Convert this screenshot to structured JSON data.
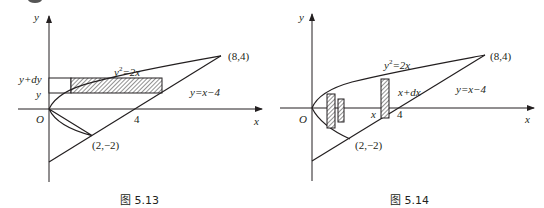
{
  "colors": {
    "ink": "#231f20",
    "hatch": "#555555"
  },
  "figures": [
    {
      "id": "fig1",
      "caption": "图 5.13",
      "axis_labels": {
        "x": "x",
        "y": "y",
        "origin": "O"
      },
      "tick_label_x": "4",
      "curve_label": "y²=2x",
      "curve_label_base": "y",
      "curve_label_sup": "2",
      "curve_label_rest": "=2x",
      "line_label": "y=x−4",
      "point_top": "(8,4)",
      "point_bottom": "(2,−2)",
      "strip_labels": {
        "upper": "y+dy",
        "lower": "y"
      },
      "strip_orientation": "horizontal"
    },
    {
      "id": "fig2",
      "caption": "图 5.14",
      "axis_labels": {
        "x": "x",
        "y": "y",
        "origin": "O"
      },
      "tick_label_x": "4",
      "curve_label_base": "y",
      "curve_label_sup": "2",
      "curve_label_rest": "=2x",
      "line_label": "y=x−4",
      "point_top": "(8,4)",
      "point_bottom": "(2,−2)",
      "strip_labels": {
        "left": "x",
        "right": "x+dx"
      },
      "strip_orientation": "vertical"
    }
  ]
}
